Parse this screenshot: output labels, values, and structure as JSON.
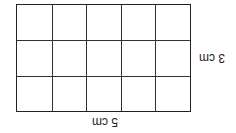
{
  "diagram": {
    "type": "area-grid-rectangle",
    "orientation": "rotated-180",
    "columns": 5,
    "rows": 3,
    "width_label": "5 cm",
    "height_label": "3 cm",
    "line_color": "#222222",
    "background": "#ffffff"
  }
}
